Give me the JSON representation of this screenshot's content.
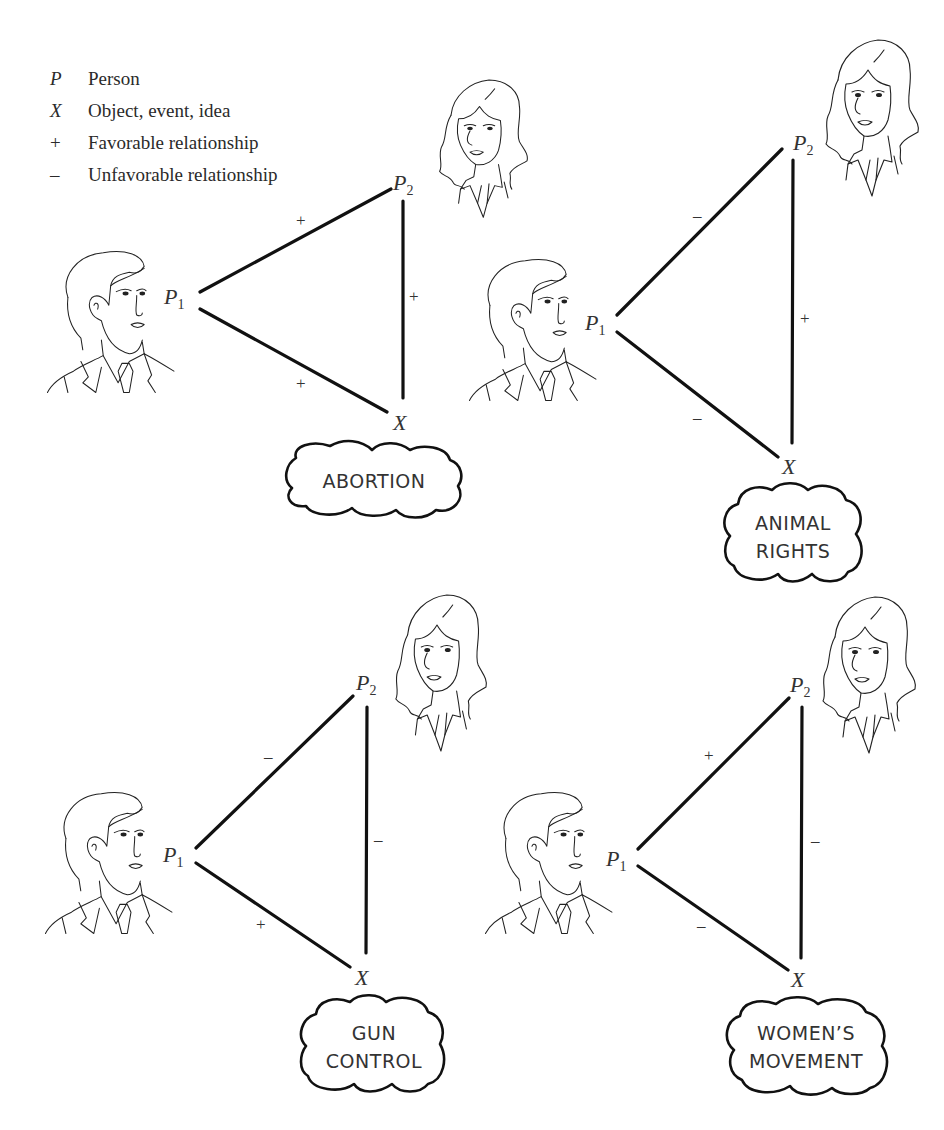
{
  "legend": [
    {
      "symbol": "P",
      "text": "Person"
    },
    {
      "symbol": "X",
      "text": "Object, event, idea"
    },
    {
      "symbol": "+",
      "text": "Favorable relationship"
    },
    {
      "symbol": "–",
      "text": "Unfavorable relationship"
    }
  ],
  "labels": {
    "p": "P",
    "x": "X",
    "sub1": "1",
    "sub2": "2"
  },
  "panels": [
    {
      "topic_lines": [
        "ABORTION"
      ],
      "p1_p2": "+",
      "p1_x": "+",
      "p2_x": "+"
    },
    {
      "topic_lines": [
        "ANIMAL",
        "RIGHTS"
      ],
      "p1_p2": "–",
      "p1_x": "–",
      "p2_x": "+"
    },
    {
      "topic_lines": [
        "GUN",
        "CONTROL"
      ],
      "p1_p2": "–",
      "p1_x": "+",
      "p2_x": "–"
    },
    {
      "topic_lines": [
        "WOMEN’S",
        "MOVEMENT"
      ],
      "p1_p2": "+",
      "p1_x": "–",
      "p2_x": "–"
    }
  ],
  "colors": {
    "line": "#111111",
    "text": "#333333",
    "background": "#ffffff"
  }
}
